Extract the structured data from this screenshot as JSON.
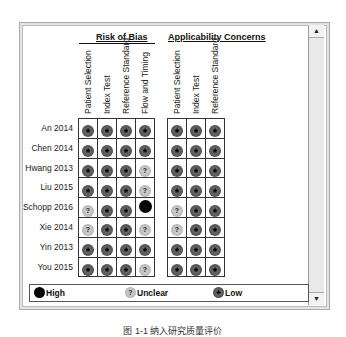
{
  "chart_data": {
    "type": "table",
    "groups": [
      {
        "name": "Risk of Bias",
        "columns": [
          "Patient Selection",
          "Index Test",
          "Reference Standard",
          "Flow and Timing"
        ]
      },
      {
        "name": "Applicability Concerns",
        "columns": [
          "Patient Selection",
          "Index Test",
          "Reference Standard"
        ]
      }
    ],
    "rows": [
      {
        "study": "An 2014",
        "risk_of_bias": [
          "Low",
          "Low",
          "Low",
          "Low"
        ],
        "applicability": [
          "Low",
          "Low",
          "Low"
        ]
      },
      {
        "study": "Chen 2014",
        "risk_of_bias": [
          "Low",
          "Low",
          "Low",
          "Low"
        ],
        "applicability": [
          "Low",
          "Low",
          "Low"
        ]
      },
      {
        "study": "Hwang 2013",
        "risk_of_bias": [
          "Low",
          "Low",
          "Low",
          "Unclear"
        ],
        "applicability": [
          "Low",
          "Low",
          "Low"
        ]
      },
      {
        "study": "Liu 2015",
        "risk_of_bias": [
          "Low",
          "Low",
          "Low",
          "Unclear"
        ],
        "applicability": [
          "Low",
          "Low",
          "Low"
        ]
      },
      {
        "study": "Schopp 2016",
        "risk_of_bias": [
          "Unclear",
          "Low",
          "Low",
          "High"
        ],
        "applicability": [
          "Unclear",
          "Low",
          "Low"
        ]
      },
      {
        "study": "Xie 2014",
        "risk_of_bias": [
          "Unclear",
          "Low",
          "Low",
          "Unclear"
        ],
        "applicability": [
          "Unclear",
          "Low",
          "Low"
        ]
      },
      {
        "study": "Yin 2013",
        "risk_of_bias": [
          "Low",
          "Low",
          "Low",
          "Low"
        ],
        "applicability": [
          "Low",
          "Low",
          "Low"
        ]
      },
      {
        "study": "You 2015",
        "risk_of_bias": [
          "Low",
          "Low",
          "Low",
          "Unclear"
        ],
        "applicability": [
          "Low",
          "Low",
          "Low"
        ]
      }
    ],
    "legend": [
      {
        "label": "High",
        "color": "#050505"
      },
      {
        "label": "Unclear",
        "color": "#b0b0b0",
        "symbol": "?"
      },
      {
        "label": "Low",
        "color": "#555555",
        "symbol": "+"
      }
    ]
  },
  "symbols": {
    "Low": "+",
    "Unclear": "?",
    "High": ""
  },
  "scrollbar": {
    "up": "▲",
    "down": "▼"
  },
  "caption": "图 1-1  纳入研究质量评价"
}
